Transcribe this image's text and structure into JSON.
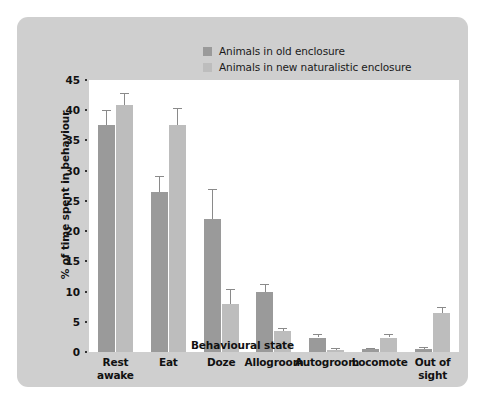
{
  "chart_data": {
    "type": "bar",
    "title": "",
    "xlabel": "Behavioural state",
    "ylabel": "% of time spent in behaviour",
    "ylim": [
      0,
      45
    ],
    "yticks": [
      0,
      5,
      10,
      15,
      20,
      25,
      30,
      35,
      40,
      45
    ],
    "grid": false,
    "legend_position": "top-center",
    "categories": [
      "Rest awake",
      "Eat",
      "Doze",
      "Allogroom",
      "Autogroom",
      "Locomote",
      "Out of sight"
    ],
    "category_lines": [
      [
        "Rest",
        "awake"
      ],
      [
        "Eat"
      ],
      [
        "Doze"
      ],
      [
        "Allogroom"
      ],
      [
        "Autogroom"
      ],
      [
        "Locomote"
      ],
      [
        "Out of",
        "sight"
      ]
    ],
    "series": [
      {
        "name": "Animals in old enclosure",
        "color": "#9a9a9a",
        "values": [
          37.5,
          26.5,
          22.0,
          10.0,
          2.4,
          0.5,
          0.5
        ],
        "errors": [
          2.5,
          2.6,
          5.0,
          1.3,
          0.6,
          0.2,
          0.3
        ]
      },
      {
        "name": "Animals in new naturalistic enclosure",
        "color": "#bdbdbd",
        "values": [
          40.8,
          37.5,
          8.0,
          3.4,
          0.4,
          2.4,
          6.4
        ],
        "errors": [
          2.0,
          2.8,
          2.5,
          0.6,
          0.2,
          0.5,
          1.0
        ]
      }
    ]
  },
  "legend": {
    "items": [
      {
        "label": "Animals in old enclosure",
        "color": "#9a9a9a"
      },
      {
        "label": "Animals in new naturalistic enclosure",
        "color": "#bdbdbd"
      }
    ]
  },
  "axes": {
    "y_title": "% of time spent in behaviour",
    "x_title": "Behavioural state"
  },
  "colors": {
    "panel_background": "#cfcfcf",
    "plot_background": "#ffffff",
    "series_old": "#9a9a9a",
    "series_new": "#bdbdbd",
    "error_bar": "#8a8a8a",
    "text": "#111111"
  }
}
